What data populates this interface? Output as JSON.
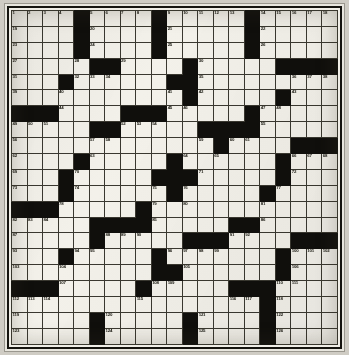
{
  "puzzle": {
    "title": "Crossword Grid",
    "type": "crossword",
    "rows": 21,
    "cols": 21,
    "colors": {
      "paper": "#efede6",
      "cell": "#f3f1ea",
      "block": "#100f0c",
      "gridline": "#3a3830",
      "number": "#18170f",
      "background": "#cfccc4"
    },
    "clue_number_range": {
      "first": 1,
      "last": 126
    },
    "grid": [
      [
        {
          "n": 1
        },
        {
          "n": 2
        },
        {
          "n": 3
        },
        {
          "n": 4
        },
        {
          "b": 1
        },
        {
          "n": 5
        },
        {
          "n": 6
        },
        {
          "n": 7
        },
        {
          "n": 8
        },
        {
          "b": 1
        },
        {
          "n": 9
        },
        {
          "n": 10
        },
        {
          "n": 11
        },
        {
          "n": 12
        },
        {
          "n": 13
        },
        {
          "b": 1
        },
        {
          "n": 14
        },
        {
          "n": 15
        },
        {
          "n": 16
        },
        {
          "n": 17
        },
        {
          "n": 18
        }
      ],
      [
        {
          "n": 19
        },
        {},
        {},
        {},
        {
          "b": 1
        },
        {
          "n": 20
        },
        {},
        {},
        {},
        {
          "b": 1
        },
        {
          "n": 21
        },
        {},
        {},
        {},
        {},
        {
          "b": 1
        },
        {
          "n": 22
        },
        {},
        {},
        {},
        {}
      ],
      [
        {
          "n": 23
        },
        {},
        {},
        {},
        {
          "b": 1
        },
        {
          "n": 24
        },
        {},
        {},
        {},
        {
          "b": 1
        },
        {
          "n": 25
        },
        {},
        {},
        {},
        {},
        {
          "b": 1
        },
        {
          "n": 26
        },
        {},
        {},
        {},
        {}
      ],
      [
        {
          "n": 27
        },
        {},
        {},
        {},
        {
          "n": 28
        },
        {
          "b": 1
        },
        {
          "b": 1
        },
        {
          "n": 29
        },
        {},
        {},
        {},
        {
          "b": 1
        },
        {
          "n": 30
        },
        {},
        {},
        {},
        {},
        {
          "b": 1
        },
        {
          "b": 1
        },
        {
          "b": 1
        },
        {
          "b": 1
        }
      ],
      [
        {
          "n": 31
        },
        {},
        {},
        {
          "b": 1
        },
        {
          "n": 32
        },
        {
          "n": 33
        },
        {
          "n": 34
        },
        {},
        {},
        {},
        {
          "b": 1
        },
        {
          "b": 1
        },
        {
          "n": 35
        },
        {},
        {},
        {},
        {},
        {},
        {
          "n": 36
        },
        {
          "n": 37
        },
        {
          "n": 38
        }
      ],
      [
        {
          "n": 39
        },
        {},
        {},
        {
          "n": 40
        },
        {},
        {},
        {},
        {},
        {},
        {},
        {
          "n": 41
        },
        {
          "b": 1
        },
        {
          "n": 42
        },
        {},
        {},
        {},
        {},
        {
          "b": 1
        },
        {
          "n": 43
        },
        {},
        {}
      ],
      [
        {
          "b": 1
        },
        {
          "b": 1
        },
        {
          "b": 1
        },
        {
          "n": 44
        },
        {},
        {},
        {},
        {
          "b": 1
        },
        {
          "b": 1
        },
        {
          "b": 1
        },
        {
          "n": 45
        },
        {
          "n": 46
        },
        {},
        {},
        {},
        {
          "b": 1
        },
        {
          "n": 47
        },
        {
          "n": 48
        },
        {},
        {},
        {}
      ],
      [
        {
          "n": 49
        },
        {
          "n": 50
        },
        {
          "n": 51
        },
        {},
        {},
        {
          "b": 1
        },
        {
          "b": 1
        },
        {
          "n": 52
        },
        {
          "n": 53
        },
        {
          "n": 54
        },
        {},
        {},
        {
          "b": 1
        },
        {
          "b": 1
        },
        {
          "b": 1
        },
        {
          "b": 1
        },
        {
          "n": 55
        },
        {},
        {},
        {},
        {}
      ],
      [
        {
          "n": 56
        },
        {},
        {},
        {},
        {},
        {
          "n": 57
        },
        {
          "n": 58
        },
        {},
        {},
        {},
        {},
        {},
        {
          "n": 59
        },
        {
          "b": 1
        },
        {
          "n": 60
        },
        {
          "n": 61
        },
        {},
        {},
        {
          "b": 1
        },
        {
          "b": 1
        },
        {
          "b": 1
        }
      ],
      [
        {
          "n": 62
        },
        {},
        {},
        {},
        {
          "b": 1
        },
        {
          "n": 63
        },
        {},
        {},
        {},
        {},
        {
          "b": 1
        },
        {
          "n": 64
        },
        {},
        {
          "n": 65
        },
        {},
        {},
        {},
        {
          "b": 1
        },
        {
          "n": 66
        },
        {
          "n": 67
        },
        {
          "n": 68
        }
      ],
      [
        {
          "n": 69
        },
        {},
        {},
        {
          "b": 1
        },
        {
          "n": 70
        },
        {},
        {},
        {},
        {},
        {
          "b": 1
        },
        {
          "b": 1
        },
        {
          "b": 1
        },
        {
          "n": 71
        },
        {},
        {},
        {},
        {},
        {
          "b": 1
        },
        {
          "n": 72
        },
        {},
        {}
      ],
      [
        {
          "n": 73
        },
        {},
        {},
        {
          "b": 1
        },
        {
          "n": 74
        },
        {},
        {},
        {},
        {},
        {
          "n": 75
        },
        {
          "b": 1
        },
        {
          "n": 76
        },
        {},
        {},
        {},
        {},
        {
          "b": 1
        },
        {
          "n": 77
        },
        {},
        {},
        {}
      ],
      [
        {
          "b": 1
        },
        {
          "b": 1
        },
        {
          "b": 1
        },
        {
          "n": 78
        },
        {},
        {},
        {},
        {},
        {
          "b": 1
        },
        {
          "n": 79
        },
        {},
        {
          "n": 80
        },
        {},
        {},
        {},
        {},
        {
          "n": 81
        },
        {},
        {},
        {},
        {}
      ],
      [
        {
          "n": 82
        },
        {
          "n": 83
        },
        {
          "n": 84
        },
        {},
        {},
        {
          "b": 1
        },
        {
          "b": 1
        },
        {
          "b": 1
        },
        {
          "b": 1
        },
        {
          "n": 85
        },
        {},
        {},
        {},
        {},
        {
          "b": 1
        },
        {
          "b": 1
        },
        {
          "n": 86
        },
        {},
        {},
        {},
        {}
      ],
      [
        {
          "n": 87
        },
        {},
        {},
        {},
        {},
        {
          "b": 1
        },
        {
          "n": 88
        },
        {
          "n": 89
        },
        {
          "n": 90
        },
        {},
        {},
        {
          "b": 1
        },
        {
          "b": 1
        },
        {
          "b": 1
        },
        {
          "n": 91
        },
        {
          "n": 92
        },
        {},
        {},
        {
          "b": 1
        },
        {
          "b": 1
        },
        {
          "b": 1
        }
      ],
      [
        {
          "n": 93
        },
        {},
        {},
        {
          "b": 1
        },
        {
          "n": 94
        },
        {
          "n": 95
        },
        {},
        {},
        {},
        {
          "b": 1
        },
        {
          "n": 96
        },
        {
          "n": 97
        },
        {
          "n": 98
        },
        {
          "n": 99
        },
        {},
        {},
        {},
        {
          "b": 1
        },
        {
          "n": 100
        },
        {
          "n": 101
        },
        {
          "n": 102
        }
      ],
      [
        {
          "n": 103
        },
        {},
        {},
        {
          "n": 104
        },
        {},
        {},
        {},
        {},
        {},
        {
          "b": 1
        },
        {
          "b": 1
        },
        {
          "n": 105
        },
        {},
        {},
        {},
        {},
        {},
        {
          "b": 1
        },
        {
          "n": 106
        },
        {},
        {}
      ],
      [
        {
          "b": 1
        },
        {
          "b": 1
        },
        {
          "b": 1
        },
        {
          "n": 107
        },
        {},
        {},
        {},
        {},
        {
          "b": 1
        },
        {
          "n": 108
        },
        {
          "n": 109
        },
        {},
        {},
        {},
        {
          "b": 1
        },
        {
          "b": 1
        },
        {
          "b": 1
        },
        {
          "n": 110
        },
        {
          "n": 111
        },
        {},
        {}
      ],
      [
        {
          "n": 112
        },
        {
          "n": 113
        },
        {
          "n": 114
        },
        {},
        {},
        {},
        {},
        {},
        {
          "n": 115
        },
        {},
        {},
        {},
        {},
        {},
        {
          "n": 116
        },
        {
          "n": 117
        },
        {
          "b": 1
        },
        {
          "n": 118
        },
        {},
        {},
        {}
      ],
      [
        {
          "n": 119
        },
        {},
        {},
        {},
        {},
        {
          "b": 1
        },
        {
          "n": 120
        },
        {},
        {},
        {},
        {},
        {
          "b": 1
        },
        {
          "n": 121
        },
        {},
        {},
        {},
        {
          "b": 1
        },
        {
          "n": 122
        },
        {},
        {},
        {}
      ],
      [
        {
          "n": 123
        },
        {},
        {},
        {},
        {},
        {
          "b": 1
        },
        {
          "n": 124
        },
        {},
        {},
        {},
        {},
        {
          "b": 1
        },
        {
          "n": 125
        },
        {},
        {},
        {},
        {
          "b": 1
        },
        {
          "n": 126
        },
        {},
        {},
        {}
      ]
    ]
  }
}
